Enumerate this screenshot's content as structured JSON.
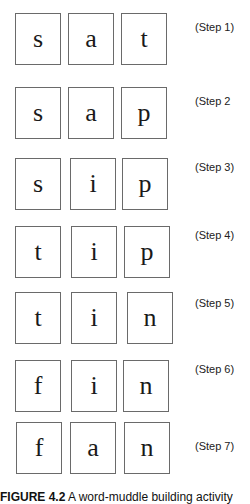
{
  "figure": {
    "rows": [
      {
        "letters": [
          "s",
          "a",
          "t"
        ],
        "step_label": "(Step 1)"
      },
      {
        "letters": [
          "s",
          "a",
          "p"
        ],
        "step_label": "(Step 2"
      },
      {
        "letters": [
          "s",
          "i",
          "p"
        ],
        "step_label": "(Step 3)"
      },
      {
        "letters": [
          "t",
          "i",
          "p"
        ],
        "step_label": "(Step 4)"
      },
      {
        "letters": [
          "t",
          "i",
          "n"
        ],
        "step_label": "(Step 5)"
      },
      {
        "letters": [
          "f",
          "i",
          "n"
        ],
        "step_label": "(Step 6)"
      },
      {
        "letters": [
          "f",
          "a",
          "n"
        ],
        "step_label": "(Step 7)"
      }
    ],
    "caption": {
      "label": "FIGURE 4.2",
      "text": " A word-muddle building activity"
    }
  }
}
